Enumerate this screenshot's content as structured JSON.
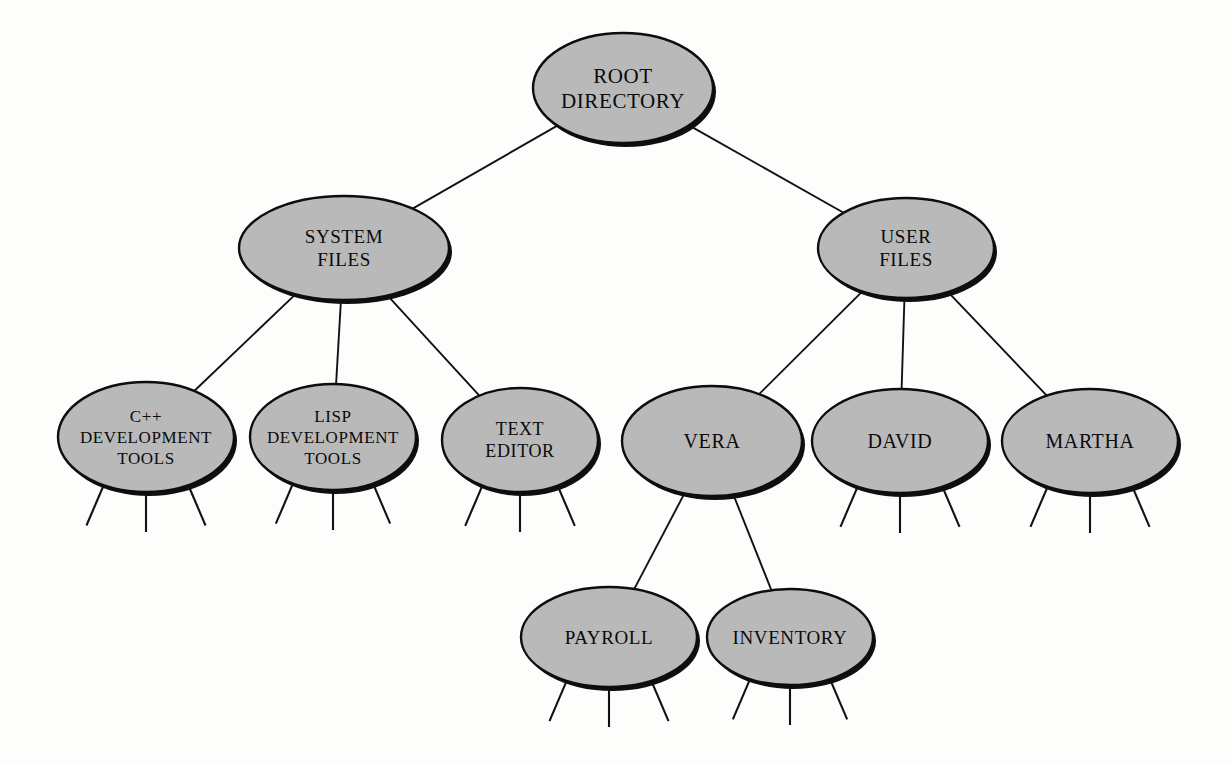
{
  "diagram": {
    "type": "hierarchical-tree",
    "background_color": "#fdfdfc",
    "node_fill_color": "#b9b9b9",
    "node_stroke_color": "#0d0d0d",
    "edge_color": "#111111",
    "node_shape": "ellipse",
    "nodes": [
      {
        "id": "root",
        "lines": [
          "ROOT",
          "DIRECTORY"
        ],
        "cx": 623,
        "cy": 88,
        "rx": 90,
        "ry": 55,
        "font_size": 21,
        "level": 0,
        "legs": 0
      },
      {
        "id": "system-files",
        "lines": [
          "SYSTEM",
          "FILES"
        ],
        "cx": 344,
        "cy": 248,
        "rx": 105,
        "ry": 52,
        "font_size": 19,
        "level": 1,
        "legs": 0
      },
      {
        "id": "user-files",
        "lines": [
          "USER",
          "FILES"
        ],
        "cx": 906,
        "cy": 248,
        "rx": 88,
        "ry": 50,
        "font_size": 19,
        "level": 1,
        "legs": 0
      },
      {
        "id": "cpp-development-tools",
        "lines": [
          "C++",
          "DEVELOPMENT",
          "TOOLS"
        ],
        "cx": 146,
        "cy": 437,
        "rx": 88,
        "ry": 55,
        "font_size": 17,
        "level": 2,
        "legs": 3
      },
      {
        "id": "lisp-development-tools",
        "lines": [
          "LISP",
          "DEVELOPMENT",
          "TOOLS"
        ],
        "cx": 333,
        "cy": 437,
        "rx": 83,
        "ry": 53,
        "font_size": 17,
        "level": 2,
        "legs": 3
      },
      {
        "id": "text-editor",
        "lines": [
          "TEXT",
          "EDITOR"
        ],
        "cx": 520,
        "cy": 440,
        "rx": 78,
        "ry": 52,
        "font_size": 18,
        "level": 2,
        "legs": 3
      },
      {
        "id": "vera",
        "lines": [
          "VERA"
        ],
        "cx": 712,
        "cy": 441,
        "rx": 90,
        "ry": 55,
        "font_size": 20,
        "level": 2,
        "legs": 0
      },
      {
        "id": "david",
        "lines": [
          "DAVID"
        ],
        "cx": 900,
        "cy": 441,
        "rx": 88,
        "ry": 52,
        "font_size": 20,
        "level": 2,
        "legs": 3
      },
      {
        "id": "martha",
        "lines": [
          "MARTHA"
        ],
        "cx": 1090,
        "cy": 441,
        "rx": 88,
        "ry": 52,
        "font_size": 20,
        "level": 2,
        "legs": 3
      },
      {
        "id": "payroll",
        "lines": [
          "PAYROLL"
        ],
        "cx": 609,
        "cy": 637,
        "rx": 88,
        "ry": 50,
        "font_size": 19,
        "level": 3,
        "legs": 3
      },
      {
        "id": "inventory",
        "lines": [
          "INVENTORY"
        ],
        "cx": 790,
        "cy": 637,
        "rx": 83,
        "ry": 48,
        "font_size": 19,
        "level": 3,
        "legs": 3
      }
    ],
    "edges": [
      {
        "from": "root",
        "to": "system-files"
      },
      {
        "from": "root",
        "to": "user-files"
      },
      {
        "from": "system-files",
        "to": "cpp-development-tools"
      },
      {
        "from": "system-files",
        "to": "lisp-development-tools"
      },
      {
        "from": "system-files",
        "to": "text-editor"
      },
      {
        "from": "user-files",
        "to": "vera"
      },
      {
        "from": "user-files",
        "to": "david"
      },
      {
        "from": "user-files",
        "to": "martha"
      },
      {
        "from": "vera",
        "to": "payroll"
      },
      {
        "from": "vera",
        "to": "inventory"
      }
    ]
  }
}
